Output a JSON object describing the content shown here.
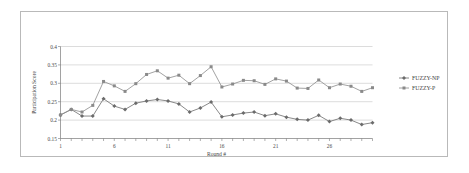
{
  "chart_data": {
    "type": "line",
    "title": "",
    "xlabel": "Round #",
    "ylabel": "Participation Score",
    "xlim": [
      1,
      30
    ],
    "ylim": [
      0.15,
      0.4
    ],
    "ytick_labels": [
      "0.4",
      "0.35",
      "0.3",
      "0.25",
      "0.2",
      "0.15"
    ],
    "ytick_values": [
      0.4,
      0.35,
      0.3,
      0.25,
      0.2,
      0.15
    ],
    "xtick_labels": [
      "1",
      "6",
      "11",
      "16",
      "21",
      "26"
    ],
    "xtick_values": [
      1,
      6,
      11,
      16,
      21,
      26
    ],
    "grid": "horizontal",
    "legend_position": "right",
    "x": [
      1,
      2,
      3,
      4,
      5,
      6,
      7,
      8,
      9,
      10,
      11,
      12,
      13,
      14,
      15,
      16,
      17,
      18,
      19,
      20,
      21,
      22,
      23,
      24,
      25,
      26,
      27,
      28,
      29,
      30
    ],
    "series": [
      {
        "name": "FUZZY-NP",
        "color": "#6b6b6b",
        "marker": "diamond",
        "values": [
          0.214,
          0.229,
          0.211,
          0.211,
          0.258,
          0.238,
          0.229,
          0.246,
          0.252,
          0.256,
          0.252,
          0.244,
          0.222,
          0.233,
          0.249,
          0.209,
          0.214,
          0.219,
          0.222,
          0.212,
          0.217,
          0.208,
          0.202,
          0.2,
          0.213,
          0.196,
          0.205,
          0.2,
          0.188,
          0.193
        ]
      },
      {
        "name": "FUZZY-P",
        "color": "#8a8a8a",
        "marker": "square",
        "values": [
          0.214,
          0.229,
          0.222,
          0.24,
          0.305,
          0.293,
          0.278,
          0.299,
          0.324,
          0.334,
          0.314,
          0.322,
          0.299,
          0.321,
          0.345,
          0.29,
          0.298,
          0.308,
          0.307,
          0.297,
          0.312,
          0.306,
          0.287,
          0.286,
          0.309,
          0.288,
          0.298,
          0.292,
          0.278,
          0.288
        ]
      }
    ]
  },
  "legend": {
    "items": [
      {
        "label": "FUZZY-NP"
      },
      {
        "label": "FUZZY-P"
      }
    ]
  },
  "colors": {
    "series_np": "#6b6b6b",
    "series_p": "#8a8a8a",
    "gridline": "#c4c4c4",
    "axis": "#7a7a7a",
    "frame": "#b9b9b9"
  }
}
